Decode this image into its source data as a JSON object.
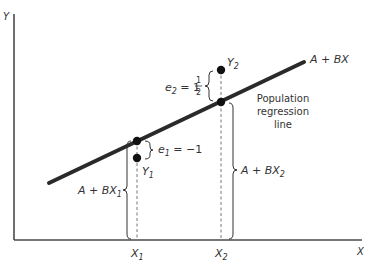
{
  "diagram": {
    "axes": {
      "y_label": "Y",
      "x_label": "X"
    },
    "regression_line": {
      "label": "A + BX",
      "description_line1": "Population",
      "description_line2": "regression",
      "description_line3": "line"
    },
    "x_ticks": [
      {
        "main": "X",
        "sub": "1"
      },
      {
        "main": "X",
        "sub": "2"
      }
    ],
    "observations": [
      {
        "label_main": "Y",
        "label_sub": "1"
      },
      {
        "label_main": "Y",
        "label_sub": "2"
      }
    ],
    "fitted_labels": [
      {
        "prefix": "A + BX",
        "sub": "1"
      },
      {
        "prefix": "A + BX",
        "sub": "2"
      }
    ],
    "errors": [
      {
        "lhs": "e",
        "sub": "1",
        "eq": " = ",
        "value": "−1"
      },
      {
        "lhs": "e",
        "sub": "2",
        "eq": " = 1",
        "frac_num": "1",
        "frac_den": "2"
      }
    ],
    "colors": {
      "line": "#2a2a2a",
      "axis": "#4a4a4a",
      "text": "#333333"
    }
  }
}
